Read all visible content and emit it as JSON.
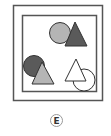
{
  "option": {
    "label": "E"
  },
  "colors": {
    "frame": "#555555",
    "dark_fill": "#5a5a5a",
    "light_fill": "#b5b5b5",
    "white_fill": "#ffffff",
    "stroke": "#333333"
  },
  "shapes": [
    {
      "type": "circle",
      "fill": "light",
      "position": "top-right-group",
      "order": "behind"
    },
    {
      "type": "triangle",
      "fill": "dark",
      "position": "top-right-group",
      "order": "front"
    },
    {
      "type": "circle",
      "fill": "dark",
      "position": "bottom-left-group",
      "order": "behind"
    },
    {
      "type": "triangle",
      "fill": "light",
      "position": "bottom-left-group",
      "order": "front"
    },
    {
      "type": "triangle",
      "fill": "white",
      "position": "bottom-right-group",
      "order": "front"
    },
    {
      "type": "circle",
      "fill": "white",
      "position": "bottom-right-group",
      "order": "behind"
    }
  ]
}
